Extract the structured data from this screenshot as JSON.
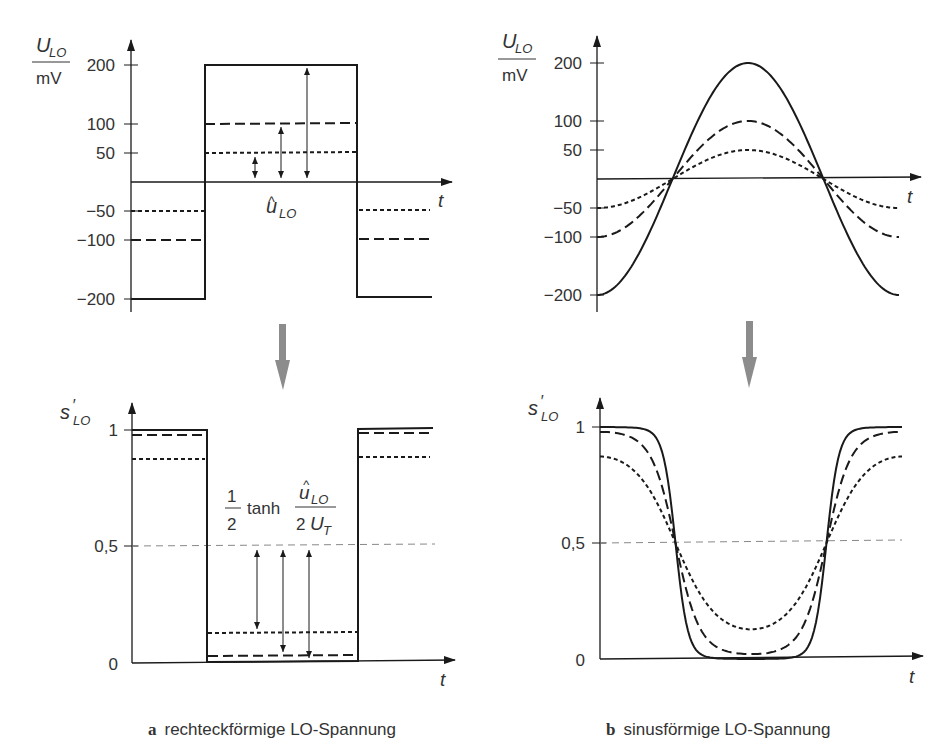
{
  "chart_data": [
    {
      "id": "a-top",
      "type": "line",
      "title": "rechteckförmige LO-Spannung (U_LO)",
      "ylabel_num": "U_LO",
      "ylabel_den": "mV",
      "xlabel": "t",
      "yticks": [
        "200",
        "100",
        "50",
        "−50",
        "−100",
        "−200"
      ],
      "ylim": [
        -200,
        200
      ],
      "annotation": "û_LO",
      "series": [
        {
          "name": "amplitude 200 mV",
          "style": "solid",
          "values": [
            -200,
            200,
            -200
          ]
        },
        {
          "name": "amplitude 100 mV",
          "style": "long-dash",
          "values": [
            -100,
            100,
            -100
          ]
        },
        {
          "name": "amplitude 50 mV",
          "style": "short-dash",
          "values": [
            -50,
            50,
            -50
          ]
        }
      ]
    },
    {
      "id": "b-top",
      "type": "line",
      "title": "sinusförmige LO-Spannung (U_LO)",
      "ylabel_num": "U_LO",
      "ylabel_den": "mV",
      "xlabel": "t",
      "yticks": [
        "200",
        "100",
        "50",
        "−50",
        "−100",
        "−200"
      ],
      "ylim": [
        -200,
        200
      ],
      "series": [
        {
          "name": "amplitude 200 mV",
          "style": "solid",
          "amplitude": 200
        },
        {
          "name": "amplitude 100 mV",
          "style": "long-dash",
          "amplitude": 100
        },
        {
          "name": "amplitude 50 mV",
          "style": "short-dash",
          "amplitude": 50
        }
      ]
    },
    {
      "id": "a-bottom",
      "type": "line",
      "title": "s'_LO for rectangular LO",
      "ylabel": "s'_LO",
      "xlabel": "t",
      "yticks": [
        "1",
        "0,5",
        "0"
      ],
      "ylim": [
        0,
        1
      ],
      "formula": {
        "prefix_num": "1",
        "prefix_den": "2",
        "func": "tanh",
        "num": "û_LO",
        "den": "2 U_T"
      },
      "series": [
        {
          "name": "200 mV",
          "style": "solid",
          "high": 1.0,
          "low": 0.0
        },
        {
          "name": "100 mV",
          "style": "long-dash",
          "high": 0.98,
          "low": 0.02
        },
        {
          "name": "50 mV",
          "style": "short-dash",
          "high": 0.88,
          "low": 0.12
        }
      ]
    },
    {
      "id": "b-bottom",
      "type": "line",
      "title": "s'_LO for sinusoidal LO",
      "ylabel": "s'_LO",
      "xlabel": "t",
      "yticks": [
        "1",
        "0,5",
        "0"
      ],
      "ylim": [
        0,
        1
      ],
      "series": [
        {
          "name": "200 mV",
          "style": "solid",
          "high": 1.0,
          "low": 0.0
        },
        {
          "name": "100 mV",
          "style": "long-dash",
          "high": 0.98,
          "low": 0.02
        },
        {
          "name": "50 mV",
          "style": "short-dash",
          "high": 0.88,
          "low": 0.12
        }
      ]
    }
  ],
  "labels": {
    "u_lo": "U",
    "u_lo_sub": "LO",
    "mv": "mV",
    "t": "t",
    "s_lo": "s",
    "s_lo_prime": "′",
    "s_lo_sub": "LO",
    "uhat": "u",
    "uhat_sub": "LO",
    "hat": "^",
    "tick_200": "200",
    "tick_100": "100",
    "tick_50": "50",
    "tick_m50": "−50",
    "tick_m100": "−100",
    "tick_m200": "−200",
    "tick_1": "1",
    "tick_05": "0,5",
    "tick_0": "0",
    "f_one": "1",
    "f_two": "2",
    "f_tanh": "tanh",
    "f_2": "2",
    "f_U": "U",
    "f_T": "T"
  },
  "captions": {
    "a_letter": "a",
    "a_text": "rechteckförmige LO-Spannung",
    "b_letter": "b",
    "b_text": "sinusförmige LO-Spannung"
  },
  "colors": {
    "ink": "#1a1a1a",
    "grey_arrow": "#8c8c8c",
    "guide": "#888888"
  }
}
